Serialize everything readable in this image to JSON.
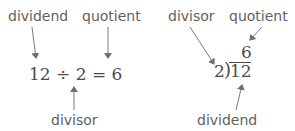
{
  "left_diagram": {
    "labels": {
      "dividend": "dividend",
      "quotient": "quotient",
      "divisor": "divisor"
    },
    "equation": {
      "dividend": "12",
      "operator": "÷",
      "divisor": "2",
      "equals": "=",
      "quotient": "6"
    }
  },
  "right_diagram": {
    "labels": {
      "divisor": "divisor",
      "quotient": "quotient",
      "dividend": "dividend"
    },
    "long_division": {
      "divisor": "2",
      "bracket": ")",
      "dividend": "12",
      "quotient": "6"
    }
  },
  "colors": {
    "label_text": "#5f5f5f",
    "math_text": "#4a4a4a",
    "arrow": "#7a7a7a",
    "background": "#ffffff"
  }
}
